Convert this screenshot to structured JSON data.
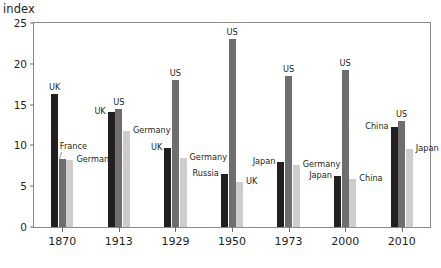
{
  "chart_data": {
    "type": "bar",
    "title": "",
    "subtitle": "",
    "xlabel": "",
    "ylabel": "index",
    "ylim": [
      0,
      25
    ],
    "yticks": [
      0,
      5,
      10,
      15,
      20,
      25
    ],
    "grid": false,
    "legend": "none (bars labeled directly)",
    "categories": [
      "1870",
      "1913",
      "1929",
      "1950",
      "1973",
      "2000",
      "2010"
    ],
    "groups": [
      {
        "category": "1870",
        "bars": [
          {
            "name": "UK",
            "value": 16.3,
            "color": "#231f20",
            "label_pos": "above"
          },
          {
            "name": "France",
            "value": 8.3,
            "color": "#6e6e6e",
            "label_pos": "leader"
          },
          {
            "name": "Germany",
            "value": 8.2,
            "color": "#cdcdcd",
            "label_pos": "right"
          }
        ]
      },
      {
        "category": "1913",
        "bars": [
          {
            "name": "UK",
            "value": 14.1,
            "color": "#231f20",
            "label_pos": "left"
          },
          {
            "name": "US",
            "value": 14.5,
            "color": "#6e6e6e",
            "label_pos": "above"
          },
          {
            "name": "Germany",
            "value": 11.8,
            "color": "#cdcdcd",
            "label_pos": "right"
          }
        ]
      },
      {
        "category": "1929",
        "bars": [
          {
            "name": "UK",
            "value": 9.7,
            "color": "#231f20",
            "label_pos": "left"
          },
          {
            "name": "US",
            "value": 18.0,
            "color": "#6e6e6e",
            "label_pos": "above"
          },
          {
            "name": "Germany",
            "value": 8.5,
            "color": "#cdcdcd",
            "label_pos": "right"
          }
        ]
      },
      {
        "category": "1950",
        "bars": [
          {
            "name": "Russia",
            "value": 6.5,
            "color": "#231f20",
            "label_pos": "left"
          },
          {
            "name": "US",
            "value": 23.0,
            "color": "#6e6e6e",
            "label_pos": "above"
          },
          {
            "name": "UK",
            "value": 5.5,
            "color": "#cdcdcd",
            "label_pos": "right"
          }
        ]
      },
      {
        "category": "1973",
        "bars": [
          {
            "name": "Japan",
            "value": 8.0,
            "color": "#231f20",
            "label_pos": "left"
          },
          {
            "name": "US",
            "value": 18.5,
            "color": "#6e6e6e",
            "label_pos": "above"
          },
          {
            "name": "Germany",
            "value": 7.6,
            "color": "#cdcdcd",
            "label_pos": "right"
          }
        ]
      },
      {
        "category": "2000",
        "bars": [
          {
            "name": "Japan",
            "value": 6.2,
            "color": "#231f20",
            "label_pos": "left"
          },
          {
            "name": "US",
            "value": 19.3,
            "color": "#6e6e6e",
            "label_pos": "above"
          },
          {
            "name": "China",
            "value": 5.9,
            "color": "#cdcdcd",
            "label_pos": "right"
          }
        ]
      },
      {
        "category": "2010",
        "bars": [
          {
            "name": "China",
            "value": 12.3,
            "color": "#231f20",
            "label_pos": "left"
          },
          {
            "name": "US",
            "value": 13.0,
            "color": "#6e6e6e",
            "label_pos": "above"
          },
          {
            "name": "Japan",
            "value": 9.5,
            "color": "#cdcdcd",
            "label_pos": "right"
          }
        ]
      }
    ],
    "extra_annotations": [
      {
        "text": "Germany",
        "series": "1973-germany-note",
        "note": "label placed left of 1973 group pointing at light bar"
      },
      {
        "text": "China",
        "series": "2010-china-note",
        "note": "label placed left of 2010 light bar region"
      }
    ]
  },
  "axis": {
    "y_title": "index"
  },
  "colors": {
    "series_dark": "#231f20",
    "series_mid": "#6e6e6e",
    "series_light": "#cdcdcd",
    "frame": "#8b8b8b",
    "text": "#231f20"
  }
}
